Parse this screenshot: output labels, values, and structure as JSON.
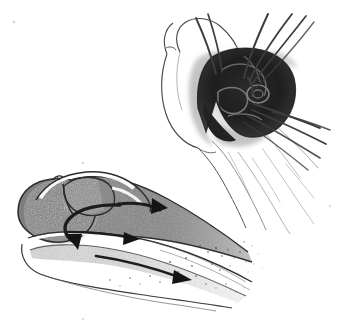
{
  "figure": {
    "medium": "grayscale halftone line drawing",
    "background_color": "#ffffff",
    "ink_color": "#2b2b2b",
    "width": 356,
    "height": 323,
    "panels": [
      {
        "id": "upper-right-panel",
        "name": "fingertip-suture-view",
        "description": "Fingertip seen from the dorsal/distal aspect with a dark V-shaped nail bed laceration held open, multiple suture strands passing through the wound and trailing off to the upper right and lower right.",
        "bbox": [
          160,
          8,
          196,
          225
        ],
        "elements": [
          {
            "name": "finger-outline",
            "type": "contour",
            "shading": "white with thin dark outline"
          },
          {
            "name": "nail-bed-wound",
            "type": "dark-region",
            "shape": "v-shaped triangular",
            "shading": "very dark grey to black"
          },
          {
            "name": "wound-shadow-halo",
            "type": "soft-shading",
            "shading": "mid grey smudge around wound"
          },
          {
            "name": "suture-strand",
            "type": "thread",
            "count": 7,
            "direction": "radiating up-right and down-right"
          },
          {
            "name": "finger-pulp-contour",
            "type": "contour",
            "direction": "trailing toward lower right"
          }
        ]
      },
      {
        "id": "lower-left-panel",
        "name": "fingertip-sagittal-cross-section",
        "description": "Sagittal cross-section of the distal fingertip showing the nail plate, germinal matrix, nail bed, distal phalanx and pulp, with directional arrows indicating the course of repair.",
        "bbox": [
          6,
          168,
          270,
          150
        ],
        "elements": [
          {
            "name": "nail-plate",
            "type": "outlined-segment",
            "shading": "white outline over grey fill"
          },
          {
            "name": "eponychium-fold",
            "type": "contour",
            "shading": "thin dark line"
          },
          {
            "name": "germinal-matrix",
            "type": "grey-region",
            "shading": "mid grey stipple"
          },
          {
            "name": "nail-bed",
            "type": "grey-region",
            "shading": "mid grey stipple fading right"
          },
          {
            "name": "distal-phalanx",
            "type": "grey-region",
            "shading": "light stipple"
          },
          {
            "name": "pulp-tissue",
            "type": "stipple-region",
            "shading": "light stipple fading to white at right"
          },
          {
            "name": "curved-arrow-hook",
            "type": "arrow",
            "direction": "curving down and to the left"
          },
          {
            "name": "straight-arrow-upper",
            "type": "arrow",
            "direction": "pointing right"
          },
          {
            "name": "straight-arrow-lower",
            "type": "arrow",
            "direction": "pointing right and slightly down"
          }
        ]
      }
    ],
    "labels": [],
    "caption": ""
  }
}
